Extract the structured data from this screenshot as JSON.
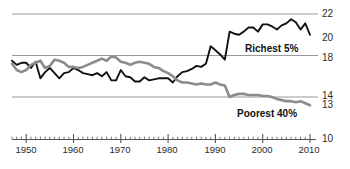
{
  "chart_data": {
    "type": "line",
    "title": "",
    "subtitle": "",
    "xlabel": "",
    "ylabel": "",
    "xlim": [
      1947,
      2010
    ],
    "ylim": [
      10,
      22
    ],
    "grid": true,
    "gridlines_y": [
      14,
      18,
      22
    ],
    "legend_position": "inline-annotation",
    "y_tick_labels": [
      "22",
      "20",
      "18",
      "14",
      "13",
      "10"
    ],
    "y_tick_values": [
      22,
      20,
      18,
      14,
      13,
      10
    ],
    "x_tick_labels": [
      "1950",
      "1960",
      "1970",
      "1980",
      "1990",
      "2000",
      "2010"
    ],
    "x_tick_values": [
      1950,
      1960,
      1970,
      1980,
      1990,
      2000,
      2010
    ],
    "x_minor_tick_step": 1,
    "series": [
      {
        "name": "Richest 5%",
        "color": "#111111",
        "annotation": "Richest 5%",
        "x": [
          1947,
          1948,
          1949,
          1950,
          1951,
          1952,
          1953,
          1954,
          1955,
          1956,
          1957,
          1958,
          1959,
          1960,
          1961,
          1962,
          1963,
          1964,
          1965,
          1966,
          1967,
          1968,
          1969,
          1970,
          1971,
          1972,
          1973,
          1974,
          1975,
          1976,
          1977,
          1978,
          1979,
          1980,
          1981,
          1982,
          1983,
          1984,
          1985,
          1986,
          1987,
          1988,
          1989,
          1990,
          1991,
          1992,
          1993,
          1994,
          1995,
          1996,
          1997,
          1998,
          1999,
          2000,
          2001,
          2002,
          2003,
          2004,
          2005,
          2006,
          2007,
          2008,
          2009,
          2010
        ],
        "values": [
          17.5,
          17.1,
          17.3,
          17.3,
          16.8,
          17.4,
          15.8,
          16.4,
          16.8,
          16.3,
          15.8,
          16.3,
          16.4,
          16.8,
          16.6,
          16.3,
          16.2,
          16.1,
          16.3,
          16.0,
          16.4,
          15.6,
          15.6,
          16.6,
          16.0,
          15.9,
          15.5,
          15.5,
          15.9,
          15.6,
          15.7,
          15.8,
          15.8,
          15.8,
          15.4,
          16.0,
          16.4,
          16.5,
          16.7,
          17.0,
          16.9,
          17.2,
          18.9,
          18.5,
          18.1,
          17.6,
          20.3,
          20.1,
          20.0,
          20.3,
          20.7,
          20.7,
          20.3,
          21.0,
          21.0,
          20.8,
          20.5,
          20.9,
          21.1,
          21.5,
          21.2,
          20.5,
          21.1,
          20.0
        ]
      },
      {
        "name": "Poorest 40%",
        "color": "#8c8c8c",
        "annotation": "Poorest 40%",
        "x": [
          1947,
          1948,
          1949,
          1950,
          1951,
          1952,
          1953,
          1954,
          1955,
          1956,
          1957,
          1958,
          1959,
          1960,
          1961,
          1962,
          1963,
          1964,
          1965,
          1966,
          1967,
          1968,
          1969,
          1970,
          1971,
          1972,
          1973,
          1974,
          1975,
          1976,
          1977,
          1978,
          1979,
          1980,
          1981,
          1982,
          1983,
          1984,
          1985,
          1986,
          1987,
          1988,
          1989,
          1990,
          1991,
          1992,
          1993,
          1994,
          1995,
          1996,
          1997,
          1998,
          1999,
          2000,
          2001,
          2002,
          2003,
          2004,
          2005,
          2006,
          2007,
          2008,
          2009,
          2010
        ],
        "values": [
          17.2,
          16.6,
          16.4,
          16.6,
          17.1,
          17.3,
          17.5,
          16.8,
          17.0,
          17.6,
          17.5,
          17.3,
          16.9,
          16.9,
          16.8,
          16.9,
          17.1,
          17.3,
          17.5,
          17.7,
          17.5,
          17.9,
          17.8,
          17.4,
          17.3,
          17.1,
          17.3,
          17.4,
          17.3,
          17.2,
          16.9,
          16.8,
          16.5,
          16.3,
          16.0,
          15.6,
          15.4,
          15.4,
          15.3,
          15.2,
          15.3,
          15.2,
          15.2,
          15.4,
          15.2,
          15.1,
          14.0,
          14.2,
          14.3,
          14.3,
          14.2,
          14.2,
          14.2,
          14.1,
          14.1,
          14.0,
          13.8,
          13.7,
          13.6,
          13.6,
          13.5,
          13.6,
          13.4,
          13.2
        ]
      }
    ]
  },
  "annotations": {
    "richest_label": "Richest 5%",
    "poorest_label": "Poorest 40%"
  },
  "colors": {
    "richest": "#111111",
    "poorest": "#8c8c8c",
    "gridline": "#9a9a9a",
    "axis": "#555555",
    "text": "#2b2b2b"
  }
}
